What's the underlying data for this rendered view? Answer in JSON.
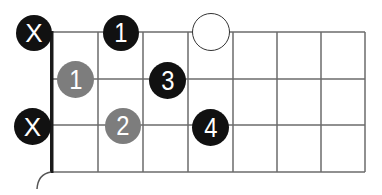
{
  "diagram": {
    "type": "guitar-chord-fretboard",
    "orientation": "horizontal",
    "strings_visible": 4,
    "frets_visible": 7,
    "muted_strings": [
      {
        "string": 1,
        "label": "X"
      },
      {
        "string": 3,
        "label": "X"
      }
    ],
    "markers": [
      {
        "string": 1,
        "fret": 2,
        "label": "1",
        "style": "black"
      },
      {
        "string": 1,
        "fret": 4,
        "label": "",
        "style": "open"
      },
      {
        "string": 2,
        "fret": 1,
        "label": "1",
        "style": "gray"
      },
      {
        "string": 2,
        "fret": 3,
        "label": "3",
        "style": "black"
      },
      {
        "string": 3,
        "fret": 2,
        "label": "2",
        "style": "gray"
      },
      {
        "string": 3,
        "fret": 4,
        "label": "4",
        "style": "black"
      }
    ],
    "colors": {
      "black_dot": "#111111",
      "gray_dot": "#7d7d7d",
      "grid_line": "#6b6b6b",
      "nut": "#1a1a1a",
      "label": "#ffffff"
    }
  }
}
